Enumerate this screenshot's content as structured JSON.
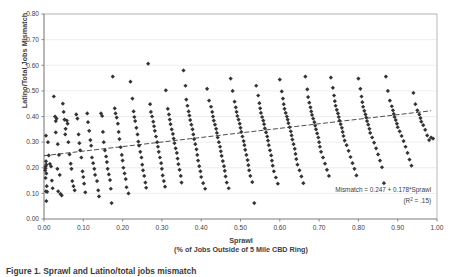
{
  "figure": {
    "caption": "Figure 1. Sprawl and Latino/total jobs mismatch"
  },
  "chart_data": {
    "type": "scatter",
    "title": "",
    "xlabel": "Sprawl",
    "xlabel_sub": "(% of Jobs Outside of 5 Mile CBD Ring)",
    "ylabel": "Latino/Total Jobs Mismatch",
    "xlim": [
      0.0,
      1.0
    ],
    "ylim": [
      0.0,
      0.8
    ],
    "xticks": [
      "0.00",
      "0.10",
      "0.20",
      "0.30",
      "0.40",
      "0.50",
      "0.60",
      "0.70",
      "0.80",
      "0.90",
      "1.00"
    ],
    "xtick_values": [
      0.0,
      0.1,
      0.2,
      0.3,
      0.4,
      0.5,
      0.6,
      0.7,
      0.8,
      0.9,
      1.0
    ],
    "yticks": [
      "0.00",
      "0.10",
      "0.20",
      "0.30",
      "0.40",
      "0.50",
      "0.60",
      "0.70",
      "0.80"
    ],
    "ytick_values": [
      0.0,
      0.1,
      0.2,
      0.3,
      0.4,
      0.5,
      0.6,
      0.7,
      0.8
    ],
    "grid": {
      "horizontal": true,
      "vertical": false
    },
    "legend": null,
    "marker": {
      "shape": "diamond",
      "color": "#333333",
      "size": 2.1
    },
    "annotations": [
      {
        "text": "Mismatch = 0.247 + 0.178*Sprawl",
        "x": 0.985,
        "y": 0.105,
        "align": "end"
      },
      {
        "text": "(R",
        "sup": "2",
        "text2": " = .15)",
        "x": 0.985,
        "y": 0.062,
        "align": "end"
      }
    ],
    "trendline": {
      "style": "dashed",
      "color": "#3a3a3a",
      "intercept": 0.247,
      "slope": 0.178,
      "r_squared": 0.15,
      "x_start": 0.0,
      "x_end": 0.985,
      "equation_label": "Mismatch = 0.247 + 0.178*Sprawl",
      "r2_label": "(R2 = .15)"
    },
    "points": [
      [
        0.005,
        0.325
      ],
      [
        0.004,
        0.205
      ],
      [
        0.004,
        0.198
      ],
      [
        0.006,
        0.212
      ],
      [
        0.003,
        0.19
      ],
      [
        0.005,
        0.225
      ],
      [
        0.006,
        0.178
      ],
      [
        0.004,
        0.16
      ],
      [
        0.007,
        0.128
      ],
      [
        0.005,
        0.108
      ],
      [
        0.008,
        0.106
      ],
      [
        0.006,
        0.07
      ],
      [
        0.01,
        0.3
      ],
      [
        0.012,
        0.248
      ],
      [
        0.015,
        0.215
      ],
      [
        0.018,
        0.205
      ],
      [
        0.02,
        0.15
      ],
      [
        0.022,
        0.12
      ],
      [
        0.025,
        0.478
      ],
      [
        0.028,
        0.4
      ],
      [
        0.03,
        0.382
      ],
      [
        0.032,
        0.392
      ],
      [
        0.03,
        0.338
      ],
      [
        0.035,
        0.292
      ],
      [
        0.038,
        0.25
      ],
      [
        0.034,
        0.196
      ],
      [
        0.04,
        0.172
      ],
      [
        0.036,
        0.108
      ],
      [
        0.042,
        0.098
      ],
      [
        0.045,
        0.092
      ],
      [
        0.048,
        0.45
      ],
      [
        0.05,
        0.418
      ],
      [
        0.052,
        0.388
      ],
      [
        0.055,
        0.352
      ],
      [
        0.058,
        0.384
      ],
      [
        0.06,
        0.372
      ],
      [
        0.054,
        0.33
      ],
      [
        0.062,
        0.3
      ],
      [
        0.065,
        0.252
      ],
      [
        0.068,
        0.216
      ],
      [
        0.07,
        0.196
      ],
      [
        0.072,
        0.148
      ],
      [
        0.075,
        0.128
      ],
      [
        0.078,
        0.112
      ],
      [
        0.082,
        0.408
      ],
      [
        0.085,
        0.392
      ],
      [
        0.088,
        0.33
      ],
      [
        0.09,
        0.296
      ],
      [
        0.092,
        0.268
      ],
      [
        0.095,
        0.24
      ],
      [
        0.098,
        0.186
      ],
      [
        0.1,
        0.164
      ],
      [
        0.102,
        0.138
      ],
      [
        0.105,
        0.104
      ],
      [
        0.11,
        0.412
      ],
      [
        0.112,
        0.378
      ],
      [
        0.115,
        0.344
      ],
      [
        0.118,
        0.308
      ],
      [
        0.12,
        0.286
      ],
      [
        0.122,
        0.24
      ],
      [
        0.125,
        0.218
      ],
      [
        0.128,
        0.196
      ],
      [
        0.13,
        0.172
      ],
      [
        0.135,
        0.148
      ],
      [
        0.138,
        0.112
      ],
      [
        0.14,
        0.088
      ],
      [
        0.145,
        0.412
      ],
      [
        0.148,
        0.402
      ],
      [
        0.15,
        0.34
      ],
      [
        0.152,
        0.3
      ],
      [
        0.155,
        0.268
      ],
      [
        0.158,
        0.244
      ],
      [
        0.16,
        0.222
      ],
      [
        0.162,
        0.196
      ],
      [
        0.165,
        0.174
      ],
      [
        0.168,
        0.152
      ],
      [
        0.17,
        0.118
      ],
      [
        0.172,
        0.062
      ],
      [
        0.175,
        0.556
      ],
      [
        0.18,
        0.432
      ],
      [
        0.182,
        0.412
      ],
      [
        0.185,
        0.396
      ],
      [
        0.188,
        0.372
      ],
      [
        0.19,
        0.34
      ],
      [
        0.192,
        0.312
      ],
      [
        0.195,
        0.28
      ],
      [
        0.198,
        0.25
      ],
      [
        0.2,
        0.228
      ],
      [
        0.202,
        0.2
      ],
      [
        0.205,
        0.178
      ],
      [
        0.208,
        0.156
      ],
      [
        0.21,
        0.124
      ],
      [
        0.215,
        0.1
      ],
      [
        0.22,
        0.536
      ],
      [
        0.225,
        0.47
      ],
      [
        0.228,
        0.42
      ],
      [
        0.23,
        0.398
      ],
      [
        0.232,
        0.382
      ],
      [
        0.235,
        0.356
      ],
      [
        0.238,
        0.33
      ],
      [
        0.24,
        0.302
      ],
      [
        0.242,
        0.286
      ],
      [
        0.245,
        0.262
      ],
      [
        0.248,
        0.24
      ],
      [
        0.25,
        0.212
      ],
      [
        0.252,
        0.19
      ],
      [
        0.255,
        0.168
      ],
      [
        0.258,
        0.142
      ],
      [
        0.26,
        0.122
      ],
      [
        0.265,
        0.606
      ],
      [
        0.27,
        0.448
      ],
      [
        0.272,
        0.418
      ],
      [
        0.275,
        0.4
      ],
      [
        0.278,
        0.38
      ],
      [
        0.28,
        0.362
      ],
      [
        0.282,
        0.344
      ],
      [
        0.285,
        0.322
      ],
      [
        0.288,
        0.3
      ],
      [
        0.29,
        0.282
      ],
      [
        0.292,
        0.262
      ],
      [
        0.295,
        0.24
      ],
      [
        0.298,
        0.218
      ],
      [
        0.3,
        0.196
      ],
      [
        0.302,
        0.17
      ],
      [
        0.305,
        0.148
      ],
      [
        0.308,
        0.126
      ],
      [
        0.31,
        0.502
      ],
      [
        0.315,
        0.43
      ],
      [
        0.318,
        0.408
      ],
      [
        0.32,
        0.388
      ],
      [
        0.322,
        0.37
      ],
      [
        0.325,
        0.35
      ],
      [
        0.328,
        0.332
      ],
      [
        0.33,
        0.314
      ],
      [
        0.332,
        0.296
      ],
      [
        0.335,
        0.276
      ],
      [
        0.338,
        0.258
      ],
      [
        0.34,
        0.236
      ],
      [
        0.342,
        0.214
      ],
      [
        0.345,
        0.192
      ],
      [
        0.348,
        0.168
      ],
      [
        0.35,
        0.142
      ],
      [
        0.355,
        0.58
      ],
      [
        0.36,
        0.52
      ],
      [
        0.362,
        0.466
      ],
      [
        0.365,
        0.442
      ],
      [
        0.368,
        0.42
      ],
      [
        0.37,
        0.404
      ],
      [
        0.372,
        0.386
      ],
      [
        0.375,
        0.368
      ],
      [
        0.378,
        0.35
      ],
      [
        0.38,
        0.33
      ],
      [
        0.382,
        0.312
      ],
      [
        0.385,
        0.292
      ],
      [
        0.388,
        0.272
      ],
      [
        0.39,
        0.25
      ],
      [
        0.392,
        0.228
      ],
      [
        0.395,
        0.206
      ],
      [
        0.398,
        0.186
      ],
      [
        0.4,
        0.164
      ],
      [
        0.405,
        0.14
      ],
      [
        0.41,
        0.118
      ],
      [
        0.415,
        0.508
      ],
      [
        0.42,
        0.462
      ],
      [
        0.425,
        0.438
      ],
      [
        0.428,
        0.418
      ],
      [
        0.43,
        0.4
      ],
      [
        0.432,
        0.384
      ],
      [
        0.435,
        0.368
      ],
      [
        0.438,
        0.352
      ],
      [
        0.44,
        0.336
      ],
      [
        0.442,
        0.318
      ],
      [
        0.445,
        0.3
      ],
      [
        0.448,
        0.282
      ],
      [
        0.45,
        0.264
      ],
      [
        0.452,
        0.246
      ],
      [
        0.455,
        0.226
      ],
      [
        0.458,
        0.206
      ],
      [
        0.46,
        0.188
      ],
      [
        0.462,
        0.166
      ],
      [
        0.465,
        0.142
      ],
      [
        0.47,
        0.12
      ],
      [
        0.475,
        0.548
      ],
      [
        0.48,
        0.5
      ],
      [
        0.485,
        0.458
      ],
      [
        0.488,
        0.436
      ],
      [
        0.49,
        0.418
      ],
      [
        0.492,
        0.402
      ],
      [
        0.495,
        0.388
      ],
      [
        0.498,
        0.372
      ],
      [
        0.5,
        0.356
      ],
      [
        0.502,
        0.34
      ],
      [
        0.505,
        0.322
      ],
      [
        0.508,
        0.304
      ],
      [
        0.51,
        0.288
      ],
      [
        0.512,
        0.27
      ],
      [
        0.515,
        0.25
      ],
      [
        0.518,
        0.23
      ],
      [
        0.52,
        0.21
      ],
      [
        0.522,
        0.19
      ],
      [
        0.525,
        0.168
      ],
      [
        0.53,
        0.144
      ],
      [
        0.535,
        0.062
      ],
      [
        0.54,
        0.52
      ],
      [
        0.545,
        0.482
      ],
      [
        0.548,
        0.452
      ],
      [
        0.55,
        0.432
      ],
      [
        0.552,
        0.414
      ],
      [
        0.555,
        0.398
      ],
      [
        0.558,
        0.384
      ],
      [
        0.56,
        0.37
      ],
      [
        0.562,
        0.354
      ],
      [
        0.565,
        0.338
      ],
      [
        0.568,
        0.322
      ],
      [
        0.57,
        0.306
      ],
      [
        0.572,
        0.288
      ],
      [
        0.575,
        0.268
      ],
      [
        0.578,
        0.248
      ],
      [
        0.58,
        0.228
      ],
      [
        0.582,
        0.208
      ],
      [
        0.585,
        0.186
      ],
      [
        0.59,
        0.162
      ],
      [
        0.595,
        0.138
      ],
      [
        0.6,
        0.544
      ],
      [
        0.605,
        0.498
      ],
      [
        0.608,
        0.47
      ],
      [
        0.61,
        0.448
      ],
      [
        0.612,
        0.43
      ],
      [
        0.615,
        0.414
      ],
      [
        0.618,
        0.4
      ],
      [
        0.62,
        0.388
      ],
      [
        0.622,
        0.374
      ],
      [
        0.625,
        0.358
      ],
      [
        0.628,
        0.342
      ],
      [
        0.63,
        0.326
      ],
      [
        0.632,
        0.31
      ],
      [
        0.635,
        0.292
      ],
      [
        0.638,
        0.274
      ],
      [
        0.64,
        0.254
      ],
      [
        0.642,
        0.234
      ],
      [
        0.645,
        0.212
      ],
      [
        0.65,
        0.19
      ],
      [
        0.655,
        0.166
      ],
      [
        0.66,
        0.14
      ],
      [
        0.665,
        0.556
      ],
      [
        0.67,
        0.506
      ],
      [
        0.672,
        0.476
      ],
      [
        0.675,
        0.454
      ],
      [
        0.678,
        0.436
      ],
      [
        0.68,
        0.42
      ],
      [
        0.682,
        0.406
      ],
      [
        0.685,
        0.392
      ],
      [
        0.688,
        0.378
      ],
      [
        0.69,
        0.364
      ],
      [
        0.692,
        0.35
      ],
      [
        0.695,
        0.334
      ],
      [
        0.698,
        0.318
      ],
      [
        0.7,
        0.3
      ],
      [
        0.702,
        0.282
      ],
      [
        0.705,
        0.262
      ],
      [
        0.71,
        0.24
      ],
      [
        0.715,
        0.216
      ],
      [
        0.72,
        0.192
      ],
      [
        0.725,
        0.168
      ],
      [
        0.73,
        0.552
      ],
      [
        0.735,
        0.512
      ],
      [
        0.738,
        0.482
      ],
      [
        0.74,
        0.46
      ],
      [
        0.742,
        0.442
      ],
      [
        0.745,
        0.426
      ],
      [
        0.748,
        0.412
      ],
      [
        0.75,
        0.398
      ],
      [
        0.752,
        0.384
      ],
      [
        0.755,
        0.37
      ],
      [
        0.758,
        0.356
      ],
      [
        0.76,
        0.34
      ],
      [
        0.762,
        0.324
      ],
      [
        0.765,
        0.306
      ],
      [
        0.77,
        0.288
      ],
      [
        0.775,
        0.266
      ],
      [
        0.78,
        0.242
      ],
      [
        0.785,
        0.218
      ],
      [
        0.79,
        0.196
      ],
      [
        0.795,
        0.17
      ],
      [
        0.8,
        0.548
      ],
      [
        0.805,
        0.508
      ],
      [
        0.808,
        0.478
      ],
      [
        0.81,
        0.456
      ],
      [
        0.812,
        0.438
      ],
      [
        0.815,
        0.422
      ],
      [
        0.818,
        0.408
      ],
      [
        0.82,
        0.396
      ],
      [
        0.822,
        0.382
      ],
      [
        0.825,
        0.368
      ],
      [
        0.828,
        0.352
      ],
      [
        0.83,
        0.336
      ],
      [
        0.835,
        0.318
      ],
      [
        0.84,
        0.298
      ],
      [
        0.845,
        0.276
      ],
      [
        0.85,
        0.252
      ],
      [
        0.855,
        0.228
      ],
      [
        0.86,
        0.202
      ],
      [
        0.865,
        0.14
      ],
      [
        0.87,
        0.556
      ],
      [
        0.875,
        0.5
      ],
      [
        0.88,
        0.462
      ],
      [
        0.885,
        0.44
      ],
      [
        0.888,
        0.424
      ],
      [
        0.89,
        0.41
      ],
      [
        0.892,
        0.398
      ],
      [
        0.895,
        0.386
      ],
      [
        0.898,
        0.372
      ],
      [
        0.9,
        0.358
      ],
      [
        0.905,
        0.342
      ],
      [
        0.91,
        0.324
      ],
      [
        0.915,
        0.304
      ],
      [
        0.92,
        0.282
      ],
      [
        0.925,
        0.258
      ],
      [
        0.93,
        0.232
      ],
      [
        0.935,
        0.208
      ],
      [
        0.94,
        0.492
      ],
      [
        0.945,
        0.448
      ],
      [
        0.95,
        0.424
      ],
      [
        0.955,
        0.408
      ],
      [
        0.958,
        0.394
      ],
      [
        0.96,
        0.38
      ],
      [
        0.965,
        0.366
      ],
      [
        0.97,
        0.348
      ],
      [
        0.975,
        0.326
      ],
      [
        0.98,
        0.308
      ],
      [
        0.985,
        0.318
      ],
      [
        0.99,
        0.314
      ]
    ]
  }
}
